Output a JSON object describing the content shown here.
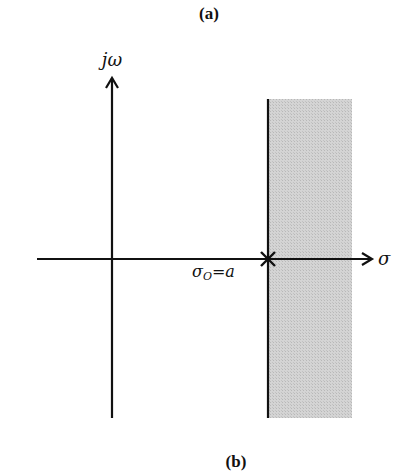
{
  "captions": {
    "top": "(a)",
    "bottom": "(b)"
  },
  "axes": {
    "vertical_label": "jω",
    "horizontal_label": "σ"
  },
  "point": {
    "symbol": "×",
    "label_main": "σ",
    "label_sub": "O",
    "label_rest": "=a"
  },
  "region": {
    "description": "shaded region of convergence to the right of σ0 = a",
    "fill_color": "#c9c9c9"
  },
  "colors": {
    "line": "#111111",
    "background": "#ffffff"
  }
}
